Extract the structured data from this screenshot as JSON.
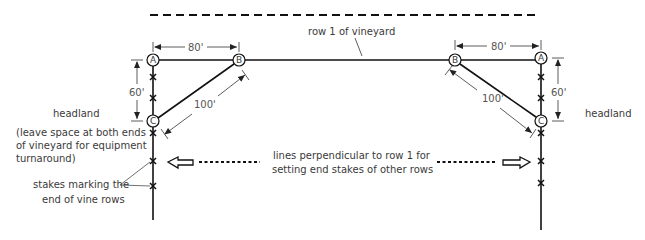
{
  "diagram": {
    "title_line": "row 1 of vineyard",
    "points": {
      "left": {
        "A": "A",
        "B": "B",
        "C": "C"
      },
      "right": {
        "A": "A",
        "B": "B",
        "C": "C"
      }
    },
    "dimensions": {
      "ab": "80'",
      "ac": "60'",
      "bc": "100'"
    },
    "labels": {
      "headland_left": "headland",
      "headland_right": "headland",
      "headland_note_line1": "(leave space at both ends",
      "headland_note_line2": "of vineyard for equipment",
      "headland_note_line3": "turnaround)",
      "stakes_line1": "stakes marking the",
      "stakes_line2": "end of vine rows",
      "perp_line1": "lines perpendicular to row 1 for",
      "perp_line2": "setting end stakes of other rows"
    },
    "colors": {
      "line": "#1a1a1a",
      "text": "#3a3a3a"
    }
  }
}
